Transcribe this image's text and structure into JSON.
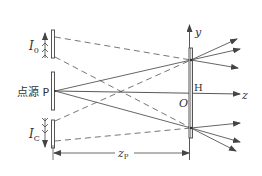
{
  "diagram": {
    "type": "optics-holography-setup",
    "colors": {
      "line": "#555555",
      "text": "#333333",
      "background": "#ffffff"
    },
    "labels": {
      "source_label": "点源 P",
      "top_beam": {
        "main": "I",
        "sub": "0"
      },
      "bottom_beam": {
        "main": "I",
        "sub": "C"
      },
      "y_axis": "y",
      "z_axis": "z",
      "origin": "O",
      "hologram": "H",
      "distance": {
        "main": "z",
        "sub": "P"
      }
    },
    "elements": [
      {
        "name": "top-grating",
        "role": "reference beam I0 aperture"
      },
      {
        "name": "source-plate",
        "role": "point source P"
      },
      {
        "name": "bottom-grating",
        "role": "conjugate beam IC aperture"
      },
      {
        "name": "hologram-plate",
        "role": "hologram H at origin O"
      }
    ]
  }
}
